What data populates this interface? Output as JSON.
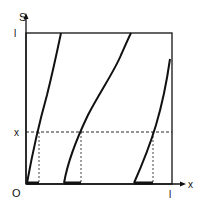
{
  "diagram": {
    "axes": {
      "y_label": "S",
      "x_label": "x",
      "origin_label": "O",
      "y_top_tick_label": "l",
      "x_right_tick_label": "l",
      "y_level_label": "x"
    },
    "curves": [
      {
        "name": "curve-1",
        "from": [
          0.0,
          0.0
        ],
        "to": [
          0.24,
          1.0
        ]
      },
      {
        "name": "curve-2",
        "from": [
          0.26,
          0.0
        ],
        "to": [
          0.72,
          1.0
        ]
      },
      {
        "name": "curve-3",
        "from": [
          0.74,
          0.0
        ],
        "to": [
          0.99,
          0.83
        ]
      }
    ],
    "level_x": 0.34,
    "intersections_x": [
      0.09,
      0.38,
      0.87
    ],
    "highlighted_segments": [
      [
        0.0,
        0.09
      ],
      [
        0.26,
        0.38
      ],
      [
        0.74,
        0.87
      ]
    ],
    "colors": {
      "stroke": "#111111",
      "background": "#ffffff"
    }
  }
}
